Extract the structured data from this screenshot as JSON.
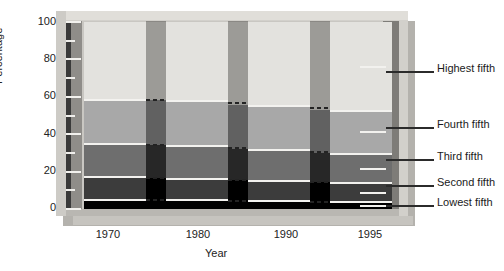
{
  "chart_data": {
    "type": "area",
    "title": "",
    "xlabel": "Year",
    "ylabel": "Percentage",
    "ylim": [
      0,
      100
    ],
    "xtick_labels": [
      "1970",
      "1980",
      "1990",
      "1995"
    ],
    "ytick_labels": [
      "0",
      "20",
      "40",
      "60",
      "80",
      "100"
    ],
    "ytick_values": [
      0,
      20,
      40,
      60,
      80,
      100
    ],
    "yminor_values": [
      10,
      30,
      50,
      70,
      90
    ],
    "grid": false,
    "legend_position": "right",
    "stacked_percent": true,
    "categories": [
      "1970",
      "1980",
      "1990",
      "1995"
    ],
    "series": [
      {
        "name": "Lowest fifth",
        "values": [
          5.4,
          5.1,
          4.6,
          4.2
        ],
        "color": "#000000"
      },
      {
        "name": "Second fifth",
        "values": [
          12.2,
          11.6,
          10.8,
          10.0
        ],
        "color": "#3c3c3c"
      },
      {
        "name": "Third fifth",
        "values": [
          17.6,
          17.5,
          16.6,
          15.8
        ],
        "color": "#6e6e6e"
      },
      {
        "name": "Fourth fifth",
        "values": [
          23.8,
          24.3,
          23.8,
          23.0
        ],
        "color": "#a8a8a8"
      },
      {
        "name": "Highest fifth",
        "values": [
          41.0,
          41.5,
          44.2,
          47.0
        ],
        "color": "#e3e2de"
      }
    ],
    "cumulative_tops": {
      "1970": [
        5.4,
        17.6,
        35.2,
        59.0,
        100
      ],
      "1980": [
        5.1,
        16.7,
        34.2,
        58.5,
        100
      ],
      "1990": [
        4.6,
        15.4,
        32.0,
        55.8,
        100
      ],
      "1995": [
        4.2,
        14.2,
        30.0,
        53.0,
        100
      ]
    }
  },
  "axes": {
    "y_title": "Percentage",
    "x_title": "Year",
    "y_ticks": [
      "100",
      "80",
      "60",
      "40",
      "20",
      "0"
    ],
    "x_ticks": [
      "1970",
      "1980",
      "1990",
      "1995"
    ]
  },
  "legend": {
    "items": [
      {
        "label": "Highest fifth"
      },
      {
        "label": "Fourth fifth"
      },
      {
        "label": "Third fifth"
      },
      {
        "label": "Second fifth"
      },
      {
        "label": "Lowest fifth"
      }
    ]
  }
}
